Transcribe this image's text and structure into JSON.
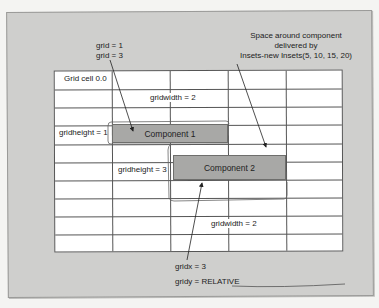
{
  "diagram": {
    "grid": {
      "columns": 5,
      "rows": 10
    },
    "labels": {
      "grid_cell_origin": "Grid cell 0.0",
      "grid_line1": "grid = 1",
      "grid_line2": "grid = 3",
      "gridwidth_top": "gridwidth = 2",
      "gridheight_1": "gridheight = 1",
      "gridheight_3": "gridheight = 3",
      "gridwidth_bottom": "gridwidth = 2",
      "gridx": "gridx = 3",
      "gridy": "gridy = RELATIVE",
      "insets_line1": "Space around component",
      "insets_line2": "delivered by",
      "insets_line3": "Insets-new Insets(5, 10, 15, 20)"
    },
    "components": [
      {
        "label": "Component 1"
      },
      {
        "label": "Component 2"
      }
    ],
    "colors": {
      "panel": "#cfcfcd",
      "grid_bg": "#ffffff",
      "component_fill": "#a8a8a6",
      "line": "#555555"
    }
  }
}
